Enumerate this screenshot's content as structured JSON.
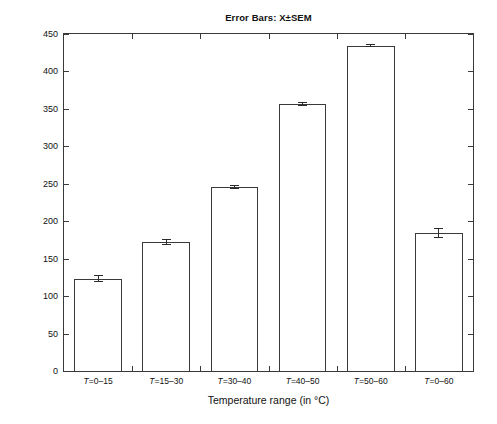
{
  "chart_data": {
    "type": "bar",
    "title": "Error Bars: X±SEM",
    "xlabel": "Temperature range (in °C)",
    "ylabel": "Pressure Deviation (ubar)",
    "categories": [
      "T=0–15",
      "T=15–30",
      "T=30–40",
      "T=40–50",
      "T=50–60",
      "T=0–60"
    ],
    "values": [
      123.5,
      172.5,
      246.0,
      357.0,
      434.0,
      184.5
    ],
    "errors": [
      4.5,
      4.0,
      2.5,
      2.5,
      2.0,
      7.0
    ],
    "ylim": [
      0,
      450
    ],
    "yticks": [
      0,
      50,
      100,
      150,
      200,
      250,
      300,
      350,
      400,
      450
    ],
    "ytick_labels": [
      "0",
      "50",
      "100",
      "150",
      "200",
      "250",
      "300",
      "350",
      "400",
      "450"
    ],
    "grid": false,
    "legend": null,
    "error_bar_type": "SEM",
    "bar_facecolor": "#ffffff",
    "bar_edgecolor": "#3a3a3a",
    "error_color": "#2b2b2b",
    "axis_color": "#3a3a3a"
  },
  "figure": {
    "background": "#ffffff"
  }
}
